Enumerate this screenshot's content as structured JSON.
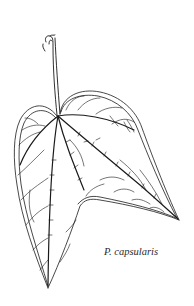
{
  "figure": {
    "caption": "P. capsularis",
    "ink_color": "#1a1a1a",
    "background": "#ffffff"
  }
}
